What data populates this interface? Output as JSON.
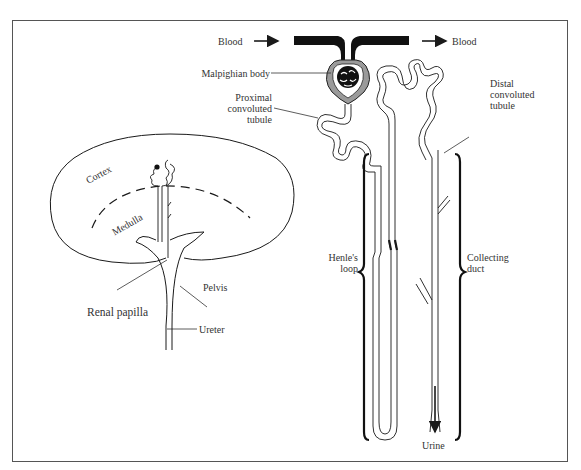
{
  "diagram": {
    "colors": {
      "ink": "#1a1a1a",
      "label": "#333333",
      "frame": "#555555",
      "capsule_fill": "#9a9a9a"
    },
    "labels": {
      "blood_in": "Blood",
      "blood_out": "Blood",
      "malpighian_body": "Malpighian body",
      "proximal": [
        "Proximal",
        "convoluted",
        "tubule"
      ],
      "distal": [
        "Distal",
        "convoluted",
        "tubule"
      ],
      "henle": [
        "Henle's",
        "loop"
      ],
      "collecting": [
        "Collecting",
        "duct"
      ],
      "urine": "Urine",
      "cortex": "Cortex",
      "medulla": "Medulla",
      "pelvis": "Pelvis",
      "renal_papilla": "Renal papilla",
      "ureter": "Ureter"
    }
  }
}
